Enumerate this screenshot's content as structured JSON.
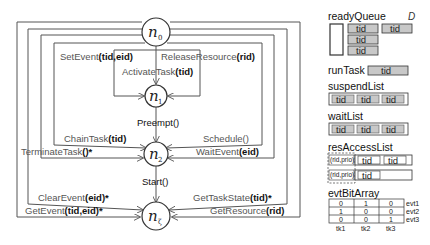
{
  "diagram": {
    "nodes": [
      {
        "id": "n0",
        "symbol": "n",
        "subscript": "0"
      },
      {
        "id": "n1",
        "symbol": "n",
        "subscript": "1"
      },
      {
        "id": "n2",
        "symbol": "n",
        "subscript": "2"
      },
      {
        "id": "nz",
        "symbol": "n",
        "subscript": "ζ"
      }
    ],
    "edges": {
      "set_event": {
        "name": "SetEvent",
        "args": "(tid,eid)"
      },
      "release_resource": {
        "name": "ReleaseResource",
        "args": "(rid)"
      },
      "activate_task": {
        "name": "ActivateTask",
        "args": "(tid)"
      },
      "preempt": {
        "name": "Preempt()",
        "args": ""
      },
      "chain_task": {
        "name": "ChainTask",
        "args": "(tid)"
      },
      "schedule": {
        "name": "Schedule()",
        "args": ""
      },
      "terminate_task": {
        "name": "TerminateTask",
        "args": "()*"
      },
      "wait_event": {
        "name": "WaitEvent",
        "args": "(eid)"
      },
      "start": {
        "name": "Start()",
        "args": ""
      },
      "clear_event": {
        "name": "ClearEvent",
        "args": "(eid)*"
      },
      "get_task_state": {
        "name": "GetTaskState",
        "args": "(tid)*"
      },
      "get_event": {
        "name": "GetEvent",
        "args": "(tid,eid)*"
      },
      "get_resource": {
        "name": "GetResource",
        "args": "(rid)"
      }
    }
  },
  "panel": {
    "domain_label": "D",
    "ready_queue": {
      "title": "readyQueue",
      "items": [
        "tid",
        "tid",
        "tid",
        "tid"
      ]
    },
    "run_task": {
      "title": "runTask",
      "item": "tid"
    },
    "suspend_list": {
      "title": "suspendList",
      "items": [
        "tid",
        "tid",
        "tid"
      ]
    },
    "wait_list": {
      "title": "waitList",
      "items": [
        "tid",
        "tid",
        "tid"
      ]
    },
    "res_access_list": {
      "title": "resAccessList",
      "rows": [
        {
          "key": "(rid,prio)",
          "items": [
            "tid",
            "tid"
          ]
        },
        {
          "key": "(rid,prio)",
          "items": [
            "tid"
          ]
        }
      ]
    },
    "evt_bit_array": {
      "title": "evtBitArray",
      "columns": [
        "tk1",
        "tk2",
        "tk3"
      ],
      "rows": [
        {
          "label": "evt1",
          "values": [
            "0",
            "1",
            "0"
          ]
        },
        {
          "label": "evt2",
          "values": [
            "1",
            "0",
            "0"
          ]
        },
        {
          "label": "evt3",
          "values": [
            "0",
            "0",
            "1"
          ]
        }
      ]
    }
  },
  "colors": {
    "line": "#555555",
    "tid_fill": "#c8c8c8",
    "label_text": "#555555"
  }
}
